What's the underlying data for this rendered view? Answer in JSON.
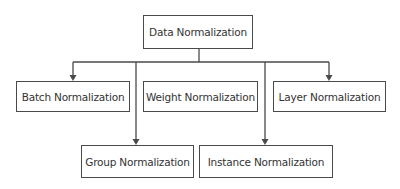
{
  "diagram": {
    "type": "hierarchy",
    "root": {
      "label": "Data Normalization"
    },
    "children": [
      {
        "label": "Batch Normalization",
        "row": 1
      },
      {
        "label": "Weight Normalization",
        "row": 1
      },
      {
        "label": "Layer Normalization",
        "row": 1
      },
      {
        "label": "Group Normalization",
        "row": 2
      },
      {
        "label": "Instance Normalization",
        "row": 2
      }
    ],
    "edges": [
      {
        "from": "Data Normalization",
        "to": "Batch Normalization",
        "arrow": true
      },
      {
        "from": "Data Normalization",
        "to": "Layer Normalization",
        "arrow": true
      },
      {
        "from": "Data Normalization",
        "to": "Group Normalization",
        "arrow": true
      },
      {
        "from": "Data Normalization",
        "to": "Instance Normalization",
        "arrow": true
      }
    ],
    "colors": {
      "stroke": "#4a4a4a",
      "text": "#333333",
      "background": "#ffffff"
    }
  }
}
